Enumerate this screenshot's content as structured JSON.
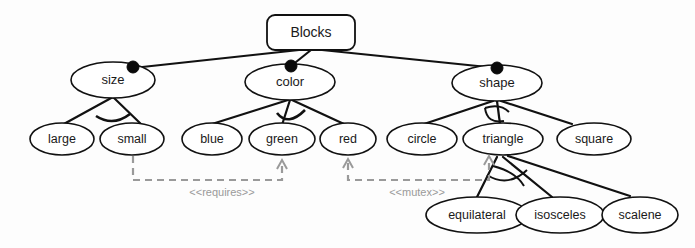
{
  "diagram": {
    "type": "feature-model",
    "title_node": {
      "label": "Blocks",
      "shape": "rounded-rect"
    },
    "level2": [
      {
        "id": "size",
        "label": "size",
        "mandatory": true
      },
      {
        "id": "color",
        "label": "color",
        "mandatory": true
      },
      {
        "id": "shape",
        "label": "shape",
        "mandatory": true
      }
    ],
    "level3": [
      {
        "id": "large",
        "label": "large",
        "parent": "size"
      },
      {
        "id": "small",
        "label": "small",
        "parent": "size"
      },
      {
        "id": "blue",
        "label": "blue",
        "parent": "color"
      },
      {
        "id": "green",
        "label": "green",
        "parent": "color"
      },
      {
        "id": "red",
        "label": "red",
        "parent": "color"
      },
      {
        "id": "circle",
        "label": "circle",
        "parent": "shape"
      },
      {
        "id": "triangle",
        "label": "triangle",
        "parent": "shape"
      },
      {
        "id": "square",
        "label": "square",
        "parent": "shape"
      }
    ],
    "level4": [
      {
        "id": "equilateral",
        "label": "equilateral",
        "parent": "triangle"
      },
      {
        "id": "isosceles",
        "label": "isosceles",
        "parent": "triangle"
      },
      {
        "id": "scalene",
        "label": "scalene",
        "parent": "triangle"
      }
    ],
    "constraints": [
      {
        "id": "requires",
        "label": "<<requires>>",
        "from": "small",
        "to": "green"
      },
      {
        "id": "mutex",
        "label": "<<mutex>>",
        "from": "red",
        "to": "triangle"
      }
    ],
    "colors": {
      "stroke": "#111111",
      "node_fill": "#ffffff",
      "constraint": "#9a9a9a",
      "background": "#fdfdfd",
      "text": "#1a1a1a"
    }
  }
}
